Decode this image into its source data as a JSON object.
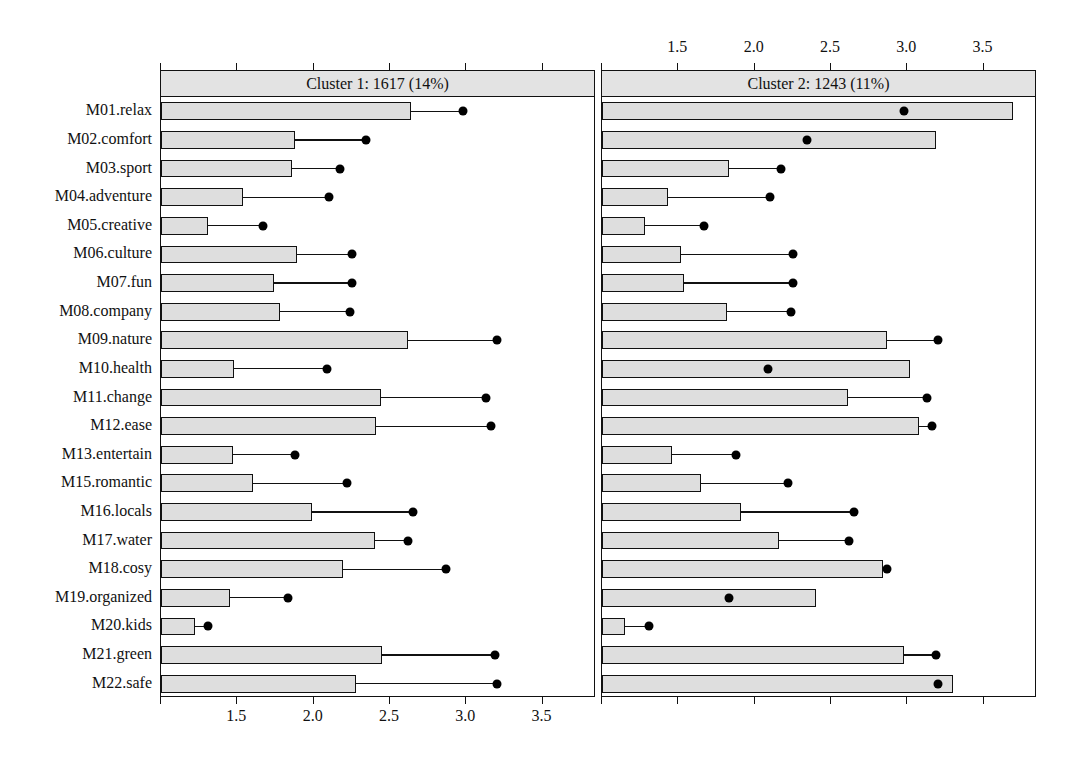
{
  "figure": {
    "title": "",
    "background": "#ffffff",
    "bar_fill": "#dedede",
    "bar_stroke": "#111111",
    "strip_fill": "#e3e3e3",
    "dot_color": "#000000"
  },
  "axis": {
    "tick_labels": [
      "1.5",
      "2.0",
      "2.5",
      "3.0",
      "3.5"
    ],
    "tick_values": [
      1.5,
      2.0,
      2.5,
      3.0,
      3.5
    ],
    "xmin": 1.0,
    "xmax": 3.85,
    "minor_ticks": [
      1.0,
      1.5,
      2.0,
      2.5,
      3.0,
      3.5
    ],
    "bottom_axis_visible": true,
    "top_axis_visible": true
  },
  "panels": [
    {
      "key": "cluster1",
      "strip": "Cluster 1: 1617 (14%)",
      "cluster": 1,
      "n": 1617,
      "pct": "14%"
    },
    {
      "key": "cluster2",
      "strip": "Cluster 2: 1243 (11%)",
      "cluster": 2,
      "n": 1243,
      "pct": "11%"
    }
  ],
  "chart_data": {
    "type": "bar",
    "title": "",
    "xlabel": "",
    "ylabel": "",
    "xlim": [
      1.0,
      3.85
    ],
    "grid": false,
    "legend": "none",
    "orientation": "horizontal",
    "note": "Grouped/trellised horizontal bar chart (dotplot overlay). Bars = cluster mean; dot = overall sample mean for each motive item.",
    "categories": [
      "M01.relax",
      "M02.comfort",
      "M03.sport",
      "M04.adventure",
      "M05.creative",
      "M06.culture",
      "M07.fun",
      "M08.company",
      "M09.nature",
      "M10.health",
      "M11.change",
      "M12.ease",
      "M13.entertain",
      "M15.romantic",
      "M16.locals",
      "M17.water",
      "M18.cosy",
      "M19.organized",
      "M20.kids",
      "M21.green",
      "M22.safe"
    ],
    "panels": [
      {
        "name": "Cluster 1: 1617 (14%)",
        "bars": [
          2.64,
          1.88,
          1.86,
          1.54,
          1.31,
          1.89,
          1.74,
          1.78,
          2.62,
          1.48,
          2.44,
          2.41,
          1.47,
          1.6,
          1.99,
          2.4,
          2.19,
          1.45,
          1.22,
          2.45,
          2.28
        ],
        "dots": [
          2.98,
          2.34,
          2.17,
          2.1,
          1.67,
          2.25,
          2.25,
          2.24,
          3.2,
          2.09,
          3.13,
          3.16,
          1.88,
          2.22,
          2.65,
          2.62,
          2.87,
          1.83,
          1.31,
          3.19,
          3.2
        ]
      },
      {
        "name": "Cluster 2: 1243 (11%)",
        "bars": [
          3.69,
          3.19,
          1.83,
          1.43,
          1.28,
          1.52,
          1.54,
          1.82,
          2.87,
          3.02,
          2.61,
          3.08,
          1.46,
          1.65,
          1.91,
          2.16,
          2.84,
          2.4,
          1.15,
          2.98,
          3.3
        ],
        "dots": [
          2.98,
          2.34,
          2.17,
          2.1,
          1.67,
          2.25,
          2.25,
          2.24,
          3.2,
          2.09,
          3.13,
          3.16,
          1.88,
          2.22,
          2.65,
          2.62,
          2.87,
          1.83,
          1.31,
          3.19,
          3.2
        ]
      }
    ]
  }
}
